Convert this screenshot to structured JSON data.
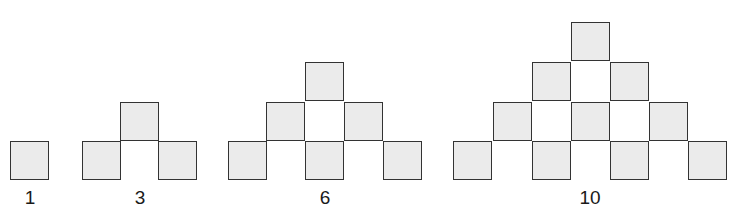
{
  "colors": {
    "square_fill": "#ebebeb",
    "square_border": "#333333",
    "label": "#1a1a1a"
  },
  "square_size": 39,
  "figures": [
    {
      "label": "1",
      "label_x": 30,
      "label_y": 188,
      "squares": [
        {
          "x": 10,
          "y": 141
        }
      ]
    },
    {
      "label": "3",
      "label_x": 140,
      "label_y": 188,
      "squares": [
        {
          "x": 120,
          "y": 102
        },
        {
          "x": 82,
          "y": 141
        },
        {
          "x": 158,
          "y": 141
        }
      ]
    },
    {
      "label": "6",
      "label_x": 325,
      "label_y": 188,
      "squares": [
        {
          "x": 305,
          "y": 62
        },
        {
          "x": 266,
          "y": 102
        },
        {
          "x": 344,
          "y": 102
        },
        {
          "x": 228,
          "y": 141
        },
        {
          "x": 305,
          "y": 141
        },
        {
          "x": 383,
          "y": 141
        }
      ]
    },
    {
      "label": "10",
      "label_x": 590,
      "label_y": 188,
      "squares": [
        {
          "x": 571,
          "y": 22
        },
        {
          "x": 532,
          "y": 62
        },
        {
          "x": 610,
          "y": 62
        },
        {
          "x": 493,
          "y": 102
        },
        {
          "x": 571,
          "y": 102
        },
        {
          "x": 649,
          "y": 102
        },
        {
          "x": 453,
          "y": 141
        },
        {
          "x": 532,
          "y": 141
        },
        {
          "x": 610,
          "y": 141
        },
        {
          "x": 688,
          "y": 141
        }
      ]
    }
  ]
}
